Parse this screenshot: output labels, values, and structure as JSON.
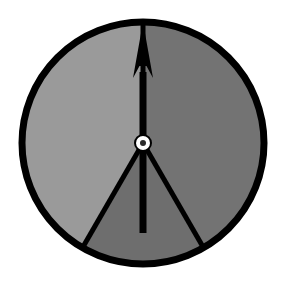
{
  "figure": {
    "name": "three-sector-dial-with-pointer",
    "background_color": "#ffffff",
    "width": 284,
    "height": 284
  },
  "dial": {
    "center_x": 143,
    "center_y": 143,
    "radius": 121,
    "outline_color": "#000000",
    "outline_width": 7,
    "divider_color": "#000000",
    "divider_width": 5,
    "sectors": [
      {
        "name": "left-sector",
        "label": "left",
        "fill": "#9a9a9a",
        "start_angle_deg": 210,
        "end_angle_deg": 360,
        "sweep_deg": 150
      },
      {
        "name": "right-sector",
        "label": "right",
        "fill": "#737373",
        "start_angle_deg": 0,
        "end_angle_deg": 150,
        "sweep_deg": 150
      },
      {
        "name": "bottom-sector",
        "label": "bottom",
        "fill": "#6e6e6e",
        "start_angle_deg": 150,
        "end_angle_deg": 210,
        "sweep_deg": 60
      }
    ]
  },
  "pointer": {
    "name": "needle",
    "color": "#000000",
    "direction_deg": 0,
    "direction_label": "up",
    "shaft_width": 7,
    "tip_y": 22,
    "tail_y": 233,
    "head_half_width": 10,
    "head_base_y": 78,
    "barb_y": 66
  },
  "hub": {
    "name": "pivot-hub",
    "outer_radius": 9,
    "outer_color": "#000000",
    "ring_radius": 7,
    "ring_color": "#ffffff",
    "inner_radius": 3,
    "inner_color": "#2a2a2a"
  },
  "chart_data": {
    "type": "pie",
    "title": "",
    "categories": [
      "left",
      "right",
      "bottom"
    ],
    "values": [
      150,
      150,
      60
    ],
    "units": "degrees",
    "colors": [
      "#9a9a9a",
      "#737373",
      "#6e6e6e"
    ],
    "pointer_angle_deg": 0,
    "legend": "none",
    "grid": false
  }
}
